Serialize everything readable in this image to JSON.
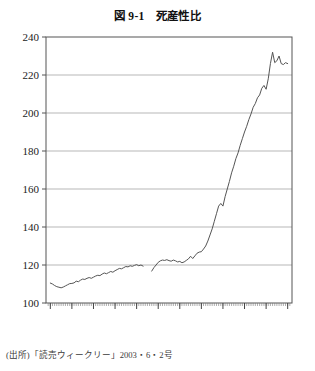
{
  "figure": {
    "title": "図 9-1　死産性比",
    "source_note": "(出所)「読売ウィークリー」2003・6・2号"
  },
  "chart_data": {
    "type": "line",
    "title": "図 9-1　死産性比",
    "xlabel": "",
    "ylabel": "",
    "xlim": [
      1898,
      2012
    ],
    "ylim": [
      100,
      240
    ],
    "yticks": [
      100,
      120,
      140,
      160,
      180,
      200,
      220,
      240
    ],
    "xticks": [
      1900,
      1910,
      1920,
      1930,
      1940,
      1950,
      1960,
      1970,
      1980,
      1990,
      2000,
      2010
    ],
    "ytick_labels": [
      "100",
      "120",
      "140",
      "160",
      "180",
      "200",
      "220",
      "240"
    ],
    "xtick_labels": [
      "1900",
      "1910",
      "1920",
      "1930",
      "1940",
      "1950",
      "1960",
      "1970",
      "1980",
      "1990",
      "2000",
      "2010"
    ],
    "grid": "horizontal",
    "minor_xticks": "every 1 year",
    "legend": "none",
    "line_color": "#555555",
    "series": [
      {
        "name": "死産性比",
        "note": "prewar segment",
        "x": [
          1900,
          1901,
          1902,
          1903,
          1904,
          1905,
          1906,
          1907,
          1908,
          1909,
          1910,
          1911,
          1912,
          1913,
          1914,
          1915,
          1916,
          1917,
          1918,
          1919,
          1920,
          1921,
          1922,
          1923,
          1924,
          1925,
          1926,
          1927,
          1928,
          1929,
          1930,
          1931,
          1932,
          1933,
          1934,
          1935,
          1936,
          1937,
          1938,
          1939,
          1940,
          1941,
          1942,
          1943
        ],
        "values": [
          110.5,
          110.0,
          109.2,
          108.6,
          108.3,
          108.0,
          108.4,
          109.0,
          109.6,
          110.2,
          110.3,
          110.6,
          111.5,
          111.2,
          112.0,
          112.6,
          112.4,
          113.0,
          113.4,
          113.0,
          113.6,
          114.2,
          114.6,
          114.4,
          115.2,
          115.8,
          115.4,
          116.0,
          116.6,
          116.2,
          117.0,
          117.6,
          118.2,
          118.0,
          118.6,
          119.2,
          119.0,
          119.6,
          119.3,
          119.8,
          120.2,
          119.6,
          120.0,
          119.4
        ]
      },
      {
        "name": "死産性比",
        "note": "postwar segment",
        "x": [
          1947,
          1948,
          1949,
          1950,
          1951,
          1952,
          1953,
          1954,
          1955,
          1956,
          1957,
          1958,
          1959,
          1960,
          1961,
          1962,
          1963,
          1964,
          1965,
          1966,
          1967,
          1968,
          1969,
          1970,
          1971,
          1972,
          1973,
          1974,
          1975,
          1976,
          1977,
          1978,
          1979,
          1980,
          1981,
          1982,
          1983,
          1984,
          1985,
          1986,
          1987,
          1988,
          1989,
          1990,
          1991,
          1992,
          1993,
          1994,
          1995,
          1996,
          1997,
          1998,
          1999,
          2000,
          2001,
          2002,
          2003,
          2004,
          2005,
          2006,
          2007,
          2008,
          2009,
          2010
        ],
        "values": [
          116.8,
          118.6,
          120.0,
          121.4,
          122.2,
          122.6,
          122.4,
          122.8,
          122.3,
          122.0,
          122.6,
          122.2,
          121.6,
          121.9,
          121.2,
          121.6,
          122.4,
          123.2,
          124.6,
          123.4,
          124.8,
          126.2,
          126.8,
          127.0,
          128.4,
          130.0,
          132.6,
          135.8,
          139.0,
          143.0,
          147.0,
          151.0,
          152.4,
          151.0,
          156.0,
          160.0,
          164.0,
          168.5,
          172.0,
          176.0,
          179.0,
          183.0,
          186.5,
          190.0,
          193.0,
          196.5,
          199.5,
          203.0,
          205.0,
          208.0,
          209.5,
          213.0,
          214.5,
          212.5,
          218.0,
          226.0,
          232.0,
          226.5,
          227.5,
          230.0,
          226.0,
          225.5,
          226.5,
          226.0
        ]
      }
    ]
  }
}
